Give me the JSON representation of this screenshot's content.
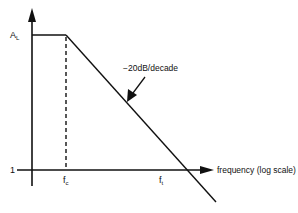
{
  "diagram": {
    "y_axis": {
      "top_label": "A",
      "top_label_sub": "L",
      "bottom_label": "1"
    },
    "x_axis": {
      "label": "frequency (log scale)"
    },
    "markers": {
      "fc": {
        "main": "f",
        "sub": "c"
      },
      "ft": {
        "main": "f",
        "sub": "t"
      }
    },
    "slope_annotation": "−20dB/decade",
    "colors": {
      "line": "#111111",
      "background": "#ffffff"
    }
  }
}
